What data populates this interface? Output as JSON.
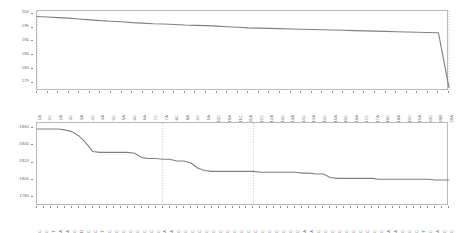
{
  "chart_data": [
    {
      "type": "line",
      "panel": "top",
      "title": "",
      "xlabel": "",
      "ylabel": "",
      "ylim": [
        172,
        201
      ],
      "yticks": [
        200,
        195,
        190,
        185,
        180,
        175
      ],
      "grid": false,
      "legend": "none",
      "line_color": "#808080",
      "marker_lines": [
        {
          "label": "1A",
          "x_index": 0,
          "style": "dotted"
        },
        {
          "label": "20A",
          "x_index": 39,
          "style": "dotted"
        }
      ],
      "categories": [
        "1A",
        "2C",
        "2A",
        "3C",
        "3A",
        "4C",
        "4A",
        "5C",
        "5A",
        "6C",
        "6A",
        "7C",
        "7A",
        "8C",
        "8A",
        "9C",
        "9A",
        "10C",
        "10A",
        "11C",
        "11A",
        "12C",
        "12A",
        "13C",
        "13A",
        "14C",
        "14A",
        "15C",
        "15A",
        "16C",
        "16A",
        "17C",
        "17A",
        "18C",
        "18A",
        "19C",
        "19A",
        "20C",
        "20B",
        "20A"
      ],
      "values": [
        199.0,
        198.8,
        198.6,
        198.4,
        198.1,
        197.8,
        197.5,
        197.3,
        197.1,
        196.8,
        196.6,
        196.4,
        196.3,
        196.1,
        195.9,
        195.8,
        195.7,
        195.5,
        195.3,
        195.1,
        194.9,
        194.8,
        194.7,
        194.6,
        194.5,
        194.4,
        194.3,
        194.2,
        194.1,
        194.0,
        193.9,
        193.8,
        193.7,
        193.6,
        193.5,
        193.4,
        193.3,
        193.2,
        193.1,
        173.2
      ]
    },
    {
      "type": "line",
      "panel": "bottom",
      "title": "",
      "xlabel": "",
      "ylabel": "",
      "ylim": [
        1770,
        1866
      ],
      "yticks": [
        1860,
        1840,
        1820,
        1800,
        1780
      ],
      "grid": false,
      "legend": "none",
      "line_color": "#808080",
      "marker_lines": [
        {
          "label": "35A",
          "x_index": 18,
          "style": "dotted"
        },
        {
          "label": "53C",
          "x_index": 31,
          "style": "dotted"
        }
      ],
      "categories": [
        "15C",
        "16C",
        "17T",
        "18A",
        "20A",
        "21C",
        "21D",
        "22C",
        "24C",
        "24T",
        "25C",
        "26C",
        "28C",
        "29C",
        "30C",
        "31C",
        "32C",
        "33C",
        "34A",
        "35A",
        "36C",
        "37C",
        "38C",
        "39C",
        "40C",
        "41C",
        "42C",
        "43C",
        "44C",
        "45C",
        "46C",
        "47C",
        "48C",
        "49C",
        "50C",
        "51C",
        "52C",
        "53C",
        "54A",
        "55A",
        "56C",
        "57C",
        "58C",
        "59C",
        "60C",
        "61C",
        "62C",
        "63C",
        "64C",
        "65C",
        "66A",
        "66A",
        "67C",
        "68C",
        "69C",
        "70T",
        "71C",
        "72A",
        "73C",
        "74C"
      ],
      "values": [
        1859,
        1859,
        1859,
        1859,
        1858,
        1856,
        1851,
        1843,
        1833,
        1832,
        1832,
        1832,
        1832,
        1832,
        1831,
        1826,
        1825,
        1825,
        1824,
        1824,
        1822,
        1822,
        1820,
        1814,
        1811,
        1810,
        1810,
        1810,
        1810,
        1810,
        1810,
        1810,
        1809,
        1809,
        1809,
        1809,
        1809,
        1809,
        1808,
        1808,
        1807,
        1807,
        1803,
        1802,
        1802,
        1802,
        1802,
        1802,
        1802,
        1801,
        1801,
        1801,
        1801,
        1801,
        1801,
        1801,
        1801,
        1800,
        1800,
        1800
      ]
    }
  ],
  "figure": {
    "panels": [
      {
        "id": "top",
        "name": "upper-line-chart"
      },
      {
        "id": "bottom",
        "name": "lower-line-chart"
      }
    ],
    "background_color": "#ffffff",
    "axis_color": "#b9b9b9",
    "tick_text_color": "#6a6a6a"
  }
}
